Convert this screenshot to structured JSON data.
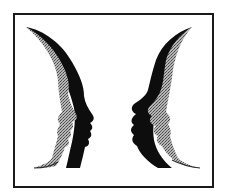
{
  "figure": {
    "colors": {
      "background": "#ffffff",
      "frame": "#1a1a1a",
      "silhouette_dark": "#0d0d0d",
      "silhouette_stipple": "#9a9a9a"
    }
  }
}
